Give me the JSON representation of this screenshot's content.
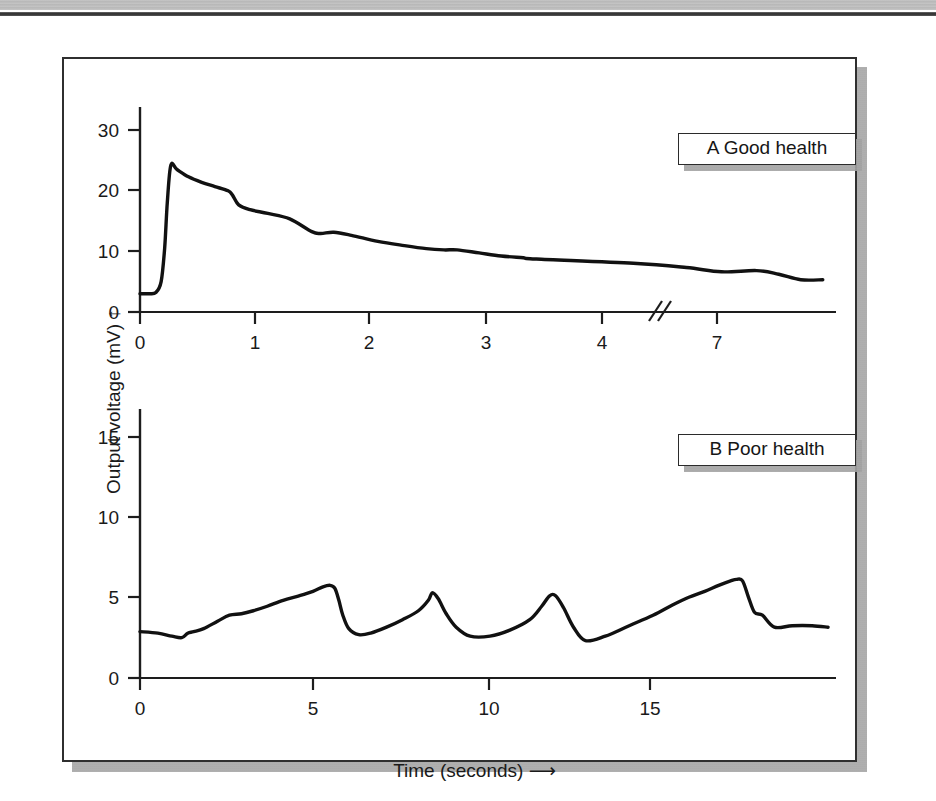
{
  "figure": {
    "y_axis_title": "Output voltage (mV)",
    "y_axis_arrow": "↑",
    "x_axis_title": "Time (seconds)",
    "x_axis_arrow": "⟶",
    "panel_a_label": "A Good health",
    "panel_b_label": "B Poor health",
    "axis_break_marker": "//"
  },
  "chart_data": [
    {
      "type": "line",
      "id": "panel-a",
      "title": "A Good health",
      "xlabel": "Time (seconds)",
      "ylabel": "Output voltage (mV)",
      "xlim": [
        0,
        7.9
      ],
      "ylim": [
        0,
        34
      ],
      "xticks": [
        0,
        1,
        2,
        3,
        4,
        7
      ],
      "xtick_labels": [
        "0",
        "1",
        "2",
        "3",
        "4",
        "7"
      ],
      "yticks": [
        0,
        10,
        20,
        30
      ],
      "ytick_labels": [
        "0",
        "10",
        "20",
        "30"
      ],
      "grid": false,
      "legend": "none",
      "axis_break": {
        "between": [
          4,
          7
        ],
        "at_x": 4.5,
        "marker": "//"
      },
      "annotations": [
        "Rapid rise to ~24 mV, then slow monotonic decay toward ~5 mV"
      ],
      "x": [
        0.0,
        0.1,
        0.18,
        0.24,
        0.28,
        0.31,
        0.35,
        0.42,
        0.55,
        0.7,
        0.85,
        1.0,
        1.05,
        1.12,
        1.25,
        1.45,
        1.7,
        1.95,
        2.05,
        2.2,
        2.4,
        2.7,
        3.0,
        3.25,
        3.45,
        3.6,
        3.85,
        4.1,
        4.35,
        4.5,
        5.6,
        6.2,
        6.6,
        7.0,
        7.25,
        7.5,
        7.75
      ],
      "y": [
        3.0,
        3.0,
        3.2,
        5.0,
        10.5,
        18.0,
        24.1,
        23.4,
        22.2,
        21.3,
        20.6,
        19.9,
        19.2,
        17.6,
        16.8,
        16.2,
        15.3,
        13.2,
        12.9,
        13.1,
        12.6,
        11.6,
        10.9,
        10.4,
        10.2,
        10.2,
        9.7,
        9.2,
        8.9,
        8.7,
        8.0,
        7.3,
        6.6,
        6.8,
        6.2,
        5.3,
        5.3
      ]
    },
    {
      "type": "line",
      "id": "panel-b",
      "title": "B Poor health",
      "xlabel": "Time (seconds)",
      "ylabel": "Output voltage (mV)",
      "xlim": [
        0,
        17.5
      ],
      "ylim": [
        0,
        18
      ],
      "xticks": [
        0,
        5,
        10,
        15
      ],
      "xtick_labels": [
        "0",
        "5",
        "10",
        "15"
      ],
      "yticks": [
        0,
        5,
        10,
        15
      ],
      "ytick_labels": [
        "0",
        "5",
        "10",
        "15"
      ],
      "grid": false,
      "legend": "none",
      "annotations": [
        "Repeating sawtooth: slow ramp up then abrupt fall; peaks ~5.5-6.6 mV"
      ],
      "x": [
        0.0,
        0.45,
        0.8,
        1.05,
        1.2,
        1.35,
        1.6,
        1.95,
        2.25,
        2.55,
        2.85,
        3.2,
        3.6,
        4.0,
        4.35,
        4.6,
        4.78,
        4.9,
        5.0,
        5.1,
        5.25,
        5.5,
        5.8,
        6.2,
        6.6,
        7.0,
        7.25,
        7.35,
        7.5,
        7.7,
        7.95,
        8.3,
        8.8,
        9.3,
        9.8,
        10.1,
        10.3,
        10.45,
        10.65,
        10.9,
        11.2,
        11.7,
        12.3,
        12.9,
        13.4,
        13.8,
        14.2,
        14.55,
        14.85,
        15.0,
        15.15,
        15.3,
        15.45,
        15.65,
        15.95,
        16.4,
        16.9,
        17.3
      ],
      "y": [
        3.1,
        3.0,
        2.8,
        2.7,
        3.0,
        3.1,
        3.3,
        3.8,
        4.2,
        4.3,
        4.5,
        4.8,
        5.2,
        5.5,
        5.8,
        6.1,
        6.2,
        6.0,
        5.2,
        4.2,
        3.3,
        2.9,
        3.0,
        3.4,
        3.9,
        4.5,
        5.2,
        5.7,
        5.3,
        4.3,
        3.4,
        2.8,
        2.8,
        3.2,
        3.9,
        4.8,
        5.5,
        5.5,
        4.7,
        3.4,
        2.5,
        2.8,
        3.5,
        4.2,
        4.9,
        5.4,
        5.8,
        6.2,
        6.5,
        6.6,
        6.5,
        5.4,
        4.4,
        4.2,
        3.4,
        3.5,
        3.5,
        3.4
      ]
    }
  ]
}
